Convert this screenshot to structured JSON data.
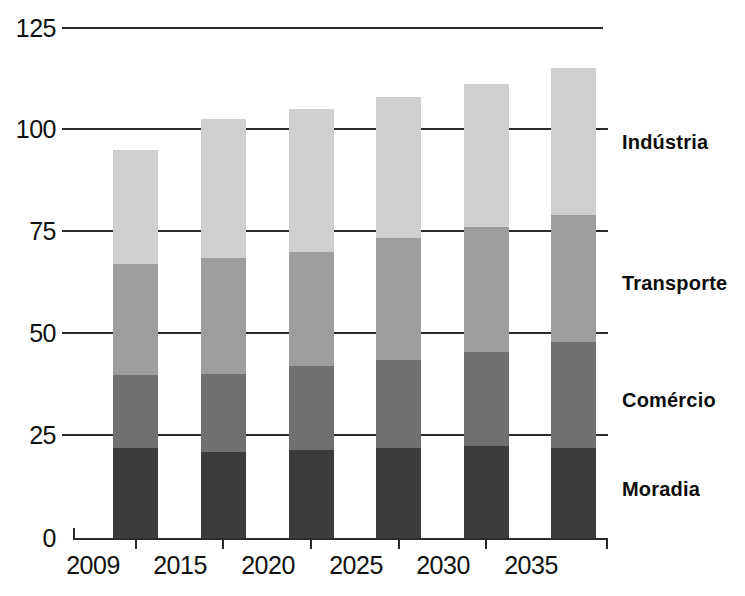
{
  "chart_data": {
    "type": "bar",
    "subtype": "stacked-column",
    "title": "",
    "xlabel": "",
    "ylabel": "",
    "categories": [
      "2009",
      "2015",
      "2020",
      "2025",
      "2030",
      "2035"
    ],
    "ylim": [
      0,
      125
    ],
    "yticks": [
      0,
      25,
      50,
      75,
      100,
      125
    ],
    "grid": true,
    "legend_position": "right",
    "series": [
      {
        "name": "Moradia",
        "color": "#3c3c3c",
        "values": [
          22,
          21,
          21.5,
          22,
          22.5,
          22
        ]
      },
      {
        "name": "Comércio",
        "color": "#707070",
        "values": [
          18,
          19,
          20.5,
          21.5,
          23,
          26
        ]
      },
      {
        "name": "Transporte",
        "color": "#9d9d9d",
        "values": [
          27,
          28.5,
          28,
          30,
          30.5,
          31
        ]
      },
      {
        "name": "Indústria",
        "color": "#cfcfcf",
        "values": [
          28,
          34,
          35,
          34.5,
          35,
          36
        ]
      }
    ],
    "totals": [
      95,
      102.5,
      105,
      108,
      111,
      115
    ]
  },
  "axis": {
    "y_tick_labels": [
      "125",
      "100",
      "75",
      "50",
      "25",
      "0"
    ],
    "x_tick_labels": [
      "2009",
      "2015",
      "2020",
      "2025",
      "2030",
      "2035"
    ]
  },
  "legend": {
    "items": [
      {
        "label": "Indústria",
        "color": "#cfcfcf"
      },
      {
        "label": "Transporte",
        "color": "#9d9d9d"
      },
      {
        "label": "Comércio",
        "color": "#707070"
      },
      {
        "label": "Moradia",
        "color": "#3c3c3c"
      }
    ]
  },
  "colors": {
    "axis": "#2b2b2b",
    "text": "#111111",
    "background": "#ffffff"
  }
}
